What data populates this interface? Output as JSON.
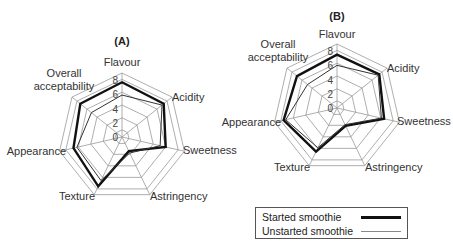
{
  "chart_data": [
    {
      "type": "radar",
      "title": "(A)",
      "axes": [
        "Flavour",
        "Acidity",
        "Sweetness",
        "Astringency",
        "Texture",
        "Appearance",
        "Overall acceptability"
      ],
      "tick_labels": [
        "0",
        "2",
        "4",
        "6",
        "8"
      ],
      "range": [
        0,
        9
      ],
      "series": [
        {
          "name": "Started smoothie",
          "values": [
            7.7,
            7.5,
            6.3,
            2.2,
            7.7,
            7.0,
            7.5
          ]
        },
        {
          "name": "Unstarted smoothie",
          "values": [
            5.9,
            7.2,
            5.5,
            2.5,
            6.8,
            6.5,
            5.5
          ]
        }
      ]
    },
    {
      "type": "radar",
      "title": "(B)",
      "axes": [
        "Flavour",
        "Acidity",
        "Sweetness",
        "Astringency",
        "Texture",
        "Appearance",
        "Overall acceptability"
      ],
      "tick_labels": [
        "0",
        "2",
        "4",
        "6",
        "8"
      ],
      "range": [
        0,
        9
      ],
      "series": [
        {
          "name": "Started smoothie",
          "values": [
            7.5,
            7.6,
            6.8,
            2.8,
            6.8,
            7.7,
            7.2
          ]
        },
        {
          "name": "Unstarted smoothie",
          "values": [
            6.0,
            7.4,
            6.4,
            2.6,
            6.2,
            7.4,
            5.3
          ]
        }
      ]
    }
  ],
  "legend": {
    "items": [
      {
        "label": "Started smoothie",
        "style": "thick"
      },
      {
        "label": "Unstarted smoothie",
        "style": "thin"
      }
    ]
  }
}
